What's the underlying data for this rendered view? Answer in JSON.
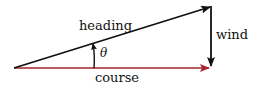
{
  "diagram": {
    "type": "vector-triangle",
    "labels": {
      "heading": "heading",
      "wind": "wind",
      "course": "course",
      "angle": "θ"
    },
    "colors": {
      "heading": "#111111",
      "wind": "#111111",
      "course": "#a3262a",
      "background": "#ffffff"
    },
    "points": {
      "origin": [
        14,
        68
      ],
      "heading_tip": [
        211,
        6
      ],
      "course_tip": [
        211,
        68
      ]
    }
  }
}
